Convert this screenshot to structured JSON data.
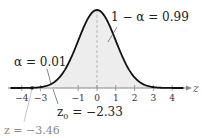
{
  "chart_data": {
    "type": "area",
    "title": "",
    "xlabel": "z",
    "ylabel": "",
    "xlim": [
      -4.5,
      4.5
    ],
    "ticks": [
      "-4",
      "-3",
      "-1",
      "0",
      "1",
      "2",
      "3",
      "4"
    ],
    "curve": "standard normal density",
    "shaded_region": {
      "from": -2.33,
      "to": 4.5,
      "area": 0.99
    },
    "annotations": {
      "center": "1 − α = 0.99",
      "tail": "α = 0.01",
      "critical": "z₀ = −2.33",
      "statistic": "z = −3.46"
    },
    "critical_value": -2.33,
    "test_statistic": -3.46,
    "alpha": 0.01,
    "confidence": 0.99
  },
  "labels": {
    "center": "1 − α = 0.99",
    "tail": "α = 0.01",
    "critical_z": "z",
    "critical_sub": "0",
    "critical_val": " = −2.33",
    "stat": "z = −3.46",
    "axis": "z"
  },
  "ticks": [
    {
      "label": "−4",
      "v": -4
    },
    {
      "label": "−3",
      "v": -3
    },
    {
      "label": "−1",
      "v": -1
    },
    {
      "label": "0",
      "v": 0
    },
    {
      "label": "1",
      "v": 1
    },
    {
      "label": "2",
      "v": 2
    },
    {
      "label": "3",
      "v": 3
    },
    {
      "label": "4",
      "v": 4
    }
  ],
  "colors": {
    "curve": "#111111",
    "shade": "#ececec",
    "axis": "#888888",
    "dashed": "#999999"
  }
}
